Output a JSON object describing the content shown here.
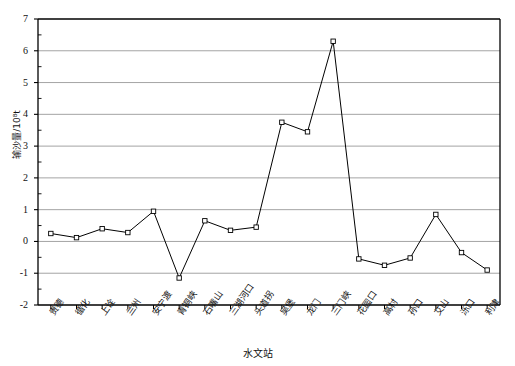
{
  "chart_data": {
    "type": "line",
    "title": "",
    "xlabel": "水文站",
    "ylabel": "输沙量/10⁸t",
    "ylim": [
      -2,
      7
    ],
    "yticks": [
      -2,
      -1,
      0,
      1,
      2,
      3,
      4,
      5,
      6,
      7
    ],
    "ytick_labels": [
      "-2",
      "-1",
      "0",
      "1",
      "2",
      "3",
      "4",
      "5",
      "6",
      "7"
    ],
    "grid": true,
    "grid_axis": "y",
    "legend": false,
    "marker": "open-square",
    "line_color": "#000000",
    "grid_color": "#9a9a9a",
    "axis_color": "#000000",
    "categories": [
      "贵德",
      "循化",
      "上诠",
      "兰州",
      "安宁渡",
      "青铜峡",
      "石嘴山",
      "三湖河口",
      "头道拐",
      "吴堡",
      "龙门",
      "三门峡",
      "花园口",
      "高村",
      "孙口",
      "艾山",
      "泺口",
      "利津"
    ],
    "values": [
      0.25,
      0.12,
      0.4,
      0.28,
      0.95,
      -1.15,
      0.65,
      0.35,
      0.45,
      3.75,
      3.45,
      6.3,
      -0.55,
      -0.75,
      -0.52,
      0.85,
      -0.35,
      -0.9
    ],
    "series": [
      {
        "name": "输沙量",
        "values": [
          0.25,
          0.12,
          0.4,
          0.28,
          0.95,
          -1.15,
          0.65,
          0.35,
          0.45,
          3.75,
          3.45,
          6.3,
          -0.55,
          -0.75,
          -0.52,
          0.85,
          -0.35,
          -0.9
        ]
      }
    ]
  },
  "plot": {
    "left": 38,
    "right": 500,
    "top": 19,
    "bottom": 305
  }
}
